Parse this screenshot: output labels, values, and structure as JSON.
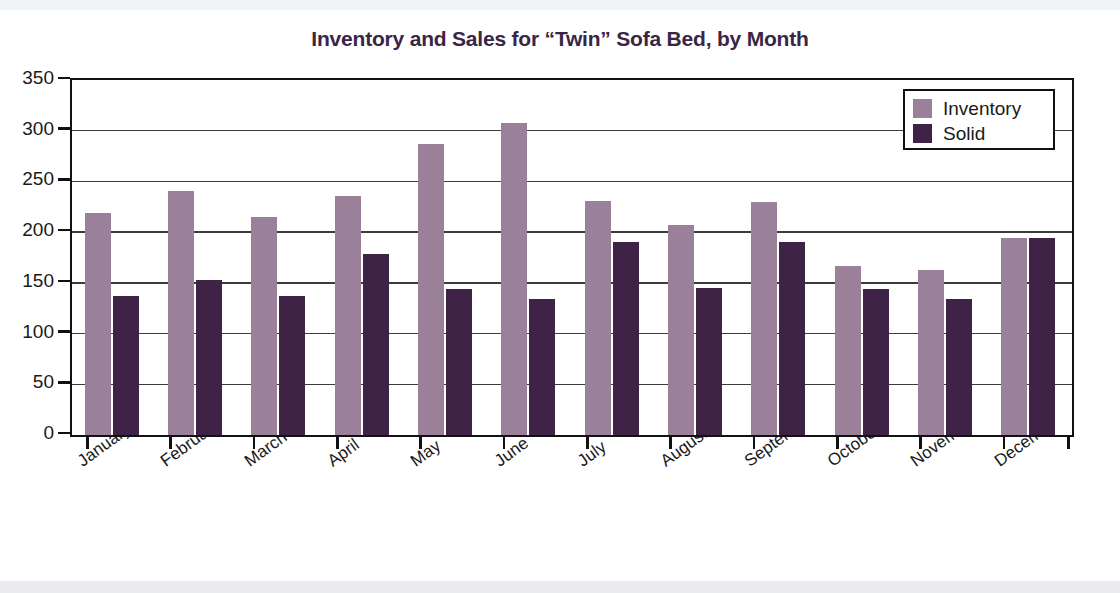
{
  "chart_data": {
    "type": "bar",
    "title": "Inventory and Sales for “Twin” Sofa Bed, by Month",
    "xlabel": "",
    "ylabel": "",
    "ylim": [
      0,
      350
    ],
    "ytick_step": 50,
    "yticks": [
      "350",
      "300",
      "250",
      "200",
      "150",
      "100",
      "50",
      "0"
    ],
    "grid": true,
    "legend_position": "top-right",
    "categories": [
      "January",
      "February",
      "March",
      "April",
      "May",
      "June",
      "July",
      "August",
      "September",
      "October",
      "November",
      "December"
    ],
    "series": [
      {
        "name": "Inventory",
        "color": "#9b8099",
        "values": [
          219,
          241,
          215,
          236,
          287,
          308,
          231,
          207,
          230,
          167,
          163,
          194
        ]
      },
      {
        "name": "Solid",
        "color": "#3f2347",
        "values": [
          137,
          153,
          137,
          178,
          144,
          134,
          190,
          145,
          190,
          144,
          134,
          194
        ]
      }
    ]
  },
  "legend": {
    "entries": [
      {
        "label": "Inventory",
        "color": "#9b8099"
      },
      {
        "label": "Solid",
        "color": "#3f2347"
      }
    ]
  },
  "colors": {
    "title": "#3b2545",
    "inventory": "#9b8099",
    "solid": "#3f2347",
    "axis": "#111111",
    "grid": "#3b3b3b",
    "background": "#ffffff"
  }
}
